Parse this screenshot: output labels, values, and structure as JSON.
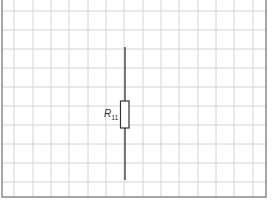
{
  "diagram": {
    "type": "circuit-schematic",
    "grid": {
      "color": "#d4d4d4",
      "border_color": "#8a8a8a",
      "x_lines": [
        14,
        33,
        51,
        69,
        88,
        106,
        124,
        143,
        161,
        179,
        198,
        216,
        234,
        253
      ],
      "y_lines": [
        11,
        30,
        49,
        68,
        87,
        106,
        125,
        144,
        163,
        182
      ],
      "border": {
        "left": 2,
        "top": 0,
        "right": 266,
        "bottom": 197
      }
    },
    "components": [
      {
        "kind": "resistor",
        "label_main": "R",
        "label_sub": "11",
        "wire_x": 125,
        "wire_top": 47,
        "wire_bottom": 180,
        "body": {
          "x": 120.5,
          "y": 101,
          "w": 8.5,
          "h": 27
        }
      }
    ],
    "wire_color": "#333333"
  }
}
